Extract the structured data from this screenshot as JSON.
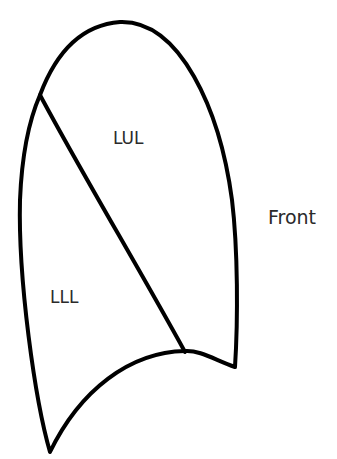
{
  "diagram": {
    "type": "left-lung-lateral-view",
    "stroke_color": "#000000",
    "background_color": "#ffffff",
    "labels": {
      "upper_lobe": "LUL",
      "lower_lobe": "LLL",
      "orientation": "Front"
    }
  }
}
